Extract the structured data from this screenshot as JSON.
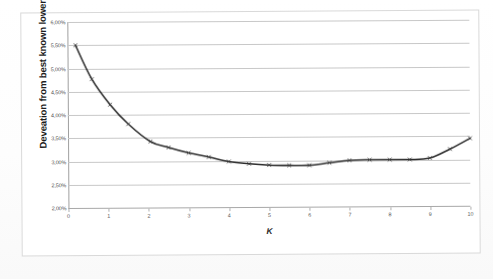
{
  "document": {
    "kind": "scanned-figure",
    "background_color": "#ffffff",
    "frame_color": "#d9d9d9"
  },
  "chart_data": {
    "type": "line",
    "title": "",
    "subtitle": "",
    "xlabel": "K",
    "ylabel": "Deveation from best known lower bound",
    "xlim": [
      0,
      10
    ],
    "ylim": [
      0.02,
      0.06
    ],
    "grid": true,
    "legend": false,
    "legend_position": "none",
    "y_tick_labels": [
      "2,00%",
      "2,50%",
      "3,00%",
      "3,50%",
      "4,00%",
      "4,50%",
      "5,00%",
      "5,50%",
      "6,00%"
    ],
    "y_tick_values": [
      0.02,
      0.025,
      0.03,
      0.035,
      0.04,
      0.045,
      0.05,
      0.055,
      0.06
    ],
    "x_tick_labels": [
      "0",
      "1",
      "2",
      "3",
      "4",
      "5",
      "6",
      "7",
      "8",
      "9",
      "10"
    ],
    "x_tick_values": [
      0,
      1,
      2,
      3,
      4,
      5,
      6,
      7,
      8,
      9,
      10
    ],
    "value_format": "percent-comma-2dp",
    "series": [
      {
        "name": "Deveation from best known lower bound",
        "color": "#2b2b2b",
        "marker": "x",
        "x": [
          0.2,
          0.6,
          1.05,
          1.5,
          2.05,
          2.5,
          3.0,
          3.5,
          4.0,
          4.5,
          5.0,
          5.5,
          6.0,
          6.5,
          7.0,
          7.5,
          8.0,
          8.5,
          9.0,
          9.5,
          10.0
        ],
        "values": [
          0.055,
          0.0477,
          0.0422,
          0.038,
          0.0342,
          0.0329,
          0.0317,
          0.0308,
          0.0298,
          0.0293,
          0.029,
          0.0289,
          0.0289,
          0.0294,
          0.0299,
          0.03,
          0.03,
          0.03,
          0.0303,
          0.0322,
          0.0345
        ]
      }
    ],
    "annotations": []
  }
}
